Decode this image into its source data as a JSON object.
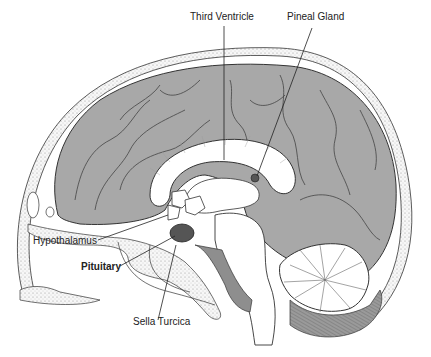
{
  "figure": {
    "colors": {
      "background": "#ffffff",
      "cortex": "#a9a9a9",
      "cortex_dark": "#8c8c8c",
      "pituitary": "#555555",
      "outline": "#333333",
      "white_matter": "#ffffff",
      "skull_fill": "#f2f2f2"
    },
    "labels": [
      {
        "id": "third-ventricle",
        "text": "Third Ventricle",
        "bold": false
      },
      {
        "id": "pineal-gland",
        "text": "Pineal Gland",
        "bold": false
      },
      {
        "id": "hypothalamus",
        "text": "Hypothalamus",
        "bold": false
      },
      {
        "id": "pituitary",
        "text": "Pituitary",
        "bold": true
      },
      {
        "id": "sella-turcica",
        "text": "Sella Turcica",
        "bold": false
      }
    ]
  }
}
